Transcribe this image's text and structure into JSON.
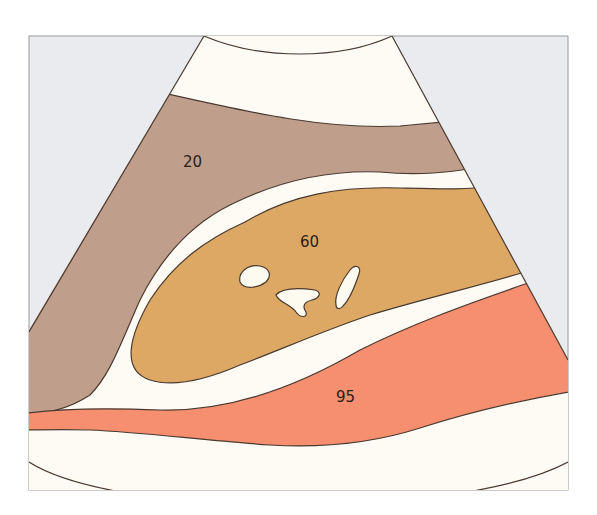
{
  "diagram": {
    "colors": {
      "background_outside_sector": "#e9ebef",
      "frame_border": "#9a9a9a",
      "near_field_band": "#fdfbf4",
      "layer_20": "#bf9e8c",
      "gap_band": "#fdfbf4",
      "layer_60": "#dda863",
      "inclusions": "#fdfbf0",
      "layer_95": "#f58f6f",
      "far_field_band": "#fefefe",
      "outline": "#4a3a30"
    },
    "labels": [
      {
        "id": "layer-20-label",
        "text": "20"
      },
      {
        "id": "layer-60-label",
        "text": "60"
      },
      {
        "id": "layer-95-label",
        "text": "95"
      }
    ]
  }
}
